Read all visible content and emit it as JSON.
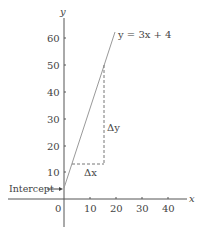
{
  "diagram": {
    "equation_label": "y = 3x + 4",
    "x_axis_label": "x",
    "y_axis_label": "y",
    "intercept_label": "Intercept",
    "delta_x_label": "Δx",
    "delta_y_label": "Δy",
    "x_ticks": [
      "0",
      "10",
      "20",
      "30",
      "40"
    ],
    "y_ticks": [
      "10",
      "20",
      "30",
      "40",
      "50",
      "60"
    ],
    "colors": {
      "axis": "#555555",
      "line": "#999999",
      "dashed": "#777777",
      "text": "#444444"
    }
  }
}
